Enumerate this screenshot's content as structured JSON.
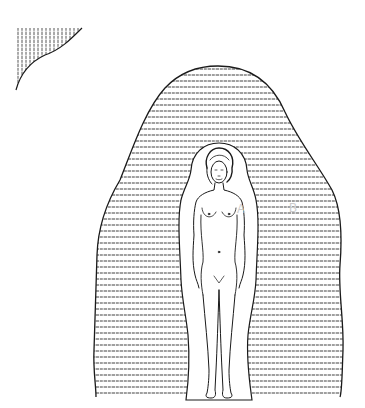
{
  "figure": {
    "labels": {
      "inner_aura": "A",
      "outer_aura": "B"
    },
    "colors": {
      "line": "#1a1a1a",
      "hatch": "#333333",
      "label": "#c8c8c8",
      "background": "#ffffff"
    }
  }
}
